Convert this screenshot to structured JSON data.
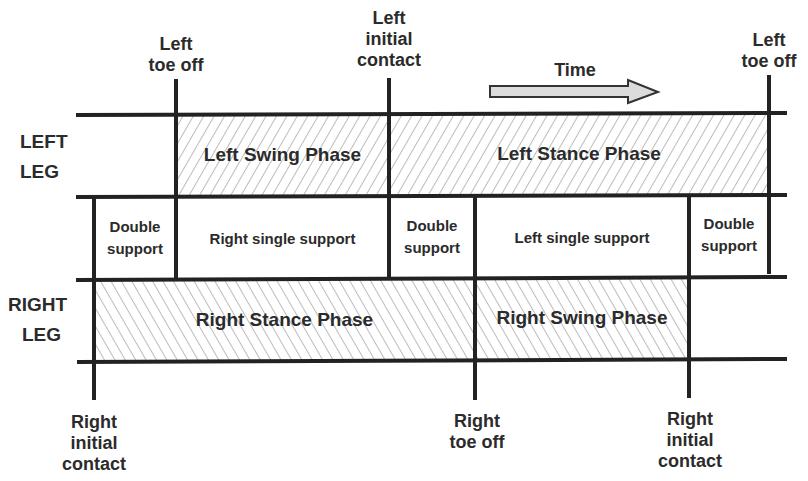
{
  "diagram": {
    "type": "gait-cycle-timeline",
    "time_label": "Time",
    "legs": {
      "left": [
        "LEFT",
        "LEG"
      ],
      "right": [
        "RIGHT",
        "LEG"
      ]
    },
    "top_events": [
      {
        "id": "left-toe-off-1",
        "lines": [
          "Left",
          "toe off"
        ]
      },
      {
        "id": "left-initial-contact",
        "lines": [
          "Left",
          "initial",
          "contact"
        ]
      },
      {
        "id": "left-toe-off-2",
        "lines": [
          "Left",
          "toe off"
        ]
      }
    ],
    "bottom_events": [
      {
        "id": "right-initial-contact-1",
        "lines": [
          "Right",
          "initial",
          "contact"
        ]
      },
      {
        "id": "right-toe-off",
        "lines": [
          "Right",
          "toe off"
        ]
      },
      {
        "id": "right-initial-contact-2",
        "lines": [
          "Right",
          "initial",
          "contact"
        ]
      }
    ],
    "left_phases": [
      {
        "label": "Left Swing Phase",
        "hatch": "forward"
      },
      {
        "label": "Left Stance Phase",
        "hatch": "forward"
      }
    ],
    "support_phases": [
      {
        "lines": [
          "Double",
          "support"
        ]
      },
      {
        "lines": [
          "Right single support"
        ]
      },
      {
        "lines": [
          "Double",
          "support"
        ]
      },
      {
        "lines": [
          "Left single support"
        ]
      },
      {
        "lines": [
          "Double",
          "support"
        ]
      }
    ],
    "right_phases": [
      {
        "label": "Right Stance Phase",
        "hatch": "backward"
      },
      {
        "label": "Right Swing Phase",
        "hatch": "backward"
      }
    ],
    "colors": {
      "line": "#222222",
      "hatch": "#777777",
      "arrow_fill": "#dcdcdc"
    }
  }
}
